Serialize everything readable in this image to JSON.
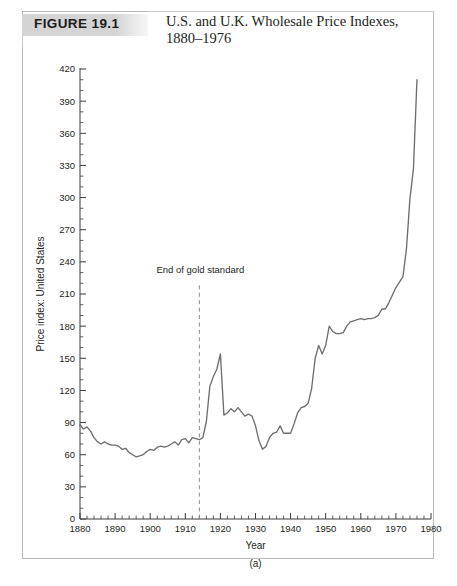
{
  "figure": {
    "tag": "FIGURE 19.1",
    "title_line1": "U.S. and U.K. Wholesale Price Indexes,",
    "title_line2": "1880–1976",
    "panel_label": "(a)"
  },
  "chart_data": {
    "type": "line",
    "title": "U.S. and U.K. Wholesale Price Indexes, 1880–1976",
    "xlabel": "Year",
    "ylabel": "Price index: United States",
    "xlim": [
      1880,
      1980
    ],
    "ylim": [
      0,
      420
    ],
    "x_major_ticks": [
      1880,
      1890,
      1900,
      1910,
      1920,
      1930,
      1940,
      1950,
      1960,
      1970,
      1980
    ],
    "x_minor_step": 2,
    "y_major_ticks": [
      0,
      30,
      60,
      90,
      120,
      150,
      180,
      210,
      240,
      270,
      300,
      330,
      360,
      390,
      420
    ],
    "y_minor_step": 10,
    "grid": false,
    "legend": null,
    "annotations": [
      {
        "text": "End of gold standard",
        "x": 1914,
        "y": 230,
        "line_from_y": 218,
        "line_to_y": 0,
        "style": "dashed-vertical"
      }
    ],
    "series": [
      {
        "name": "Price index: United States",
        "color": "#6e6e6e",
        "x": [
          1880,
          1881,
          1882,
          1883,
          1884,
          1885,
          1886,
          1887,
          1888,
          1889,
          1890,
          1891,
          1892,
          1893,
          1894,
          1895,
          1896,
          1897,
          1898,
          1899,
          1900,
          1901,
          1902,
          1903,
          1904,
          1905,
          1906,
          1907,
          1908,
          1909,
          1910,
          1911,
          1912,
          1913,
          1914,
          1915,
          1916,
          1917,
          1918,
          1919,
          1920,
          1921,
          1922,
          1923,
          1924,
          1925,
          1926,
          1927,
          1928,
          1929,
          1930,
          1931,
          1932,
          1933,
          1934,
          1935,
          1936,
          1937,
          1938,
          1939,
          1940,
          1941,
          1942,
          1943,
          1944,
          1945,
          1946,
          1947,
          1948,
          1949,
          1950,
          1951,
          1952,
          1953,
          1954,
          1955,
          1956,
          1957,
          1958,
          1959,
          1960,
          1961,
          1962,
          1963,
          1964,
          1965,
          1966,
          1967,
          1968,
          1969,
          1970,
          1971,
          1972,
          1973,
          1974,
          1975,
          1976
        ],
        "values": [
          88,
          84,
          86,
          82,
          76,
          72,
          70,
          72,
          70,
          69,
          69,
          68,
          65,
          66,
          62,
          60,
          58,
          59,
          60,
          63,
          65,
          64,
          67,
          68,
          67,
          68,
          70,
          72,
          69,
          74,
          75,
          71,
          76,
          75,
          74,
          76,
          91,
          124,
          133,
          140,
          154,
          97,
          99,
          103,
          100,
          104,
          100,
          96,
          98,
          96,
          87,
          73,
          65,
          68,
          76,
          80,
          81,
          87,
          80,
          80,
          80,
          89,
          99,
          104,
          105,
          108,
          122,
          150,
          162,
          154,
          162,
          180,
          175,
          173,
          173,
          174,
          180,
          184,
          185,
          186,
          187,
          186,
          187,
          187,
          188,
          190,
          196,
          196,
          202,
          209,
          216,
          221,
          226,
          252,
          299,
          327,
          410
        ]
      }
    ]
  },
  "axis": {
    "y_label": "Price index: United States",
    "x_label": "Year"
  }
}
